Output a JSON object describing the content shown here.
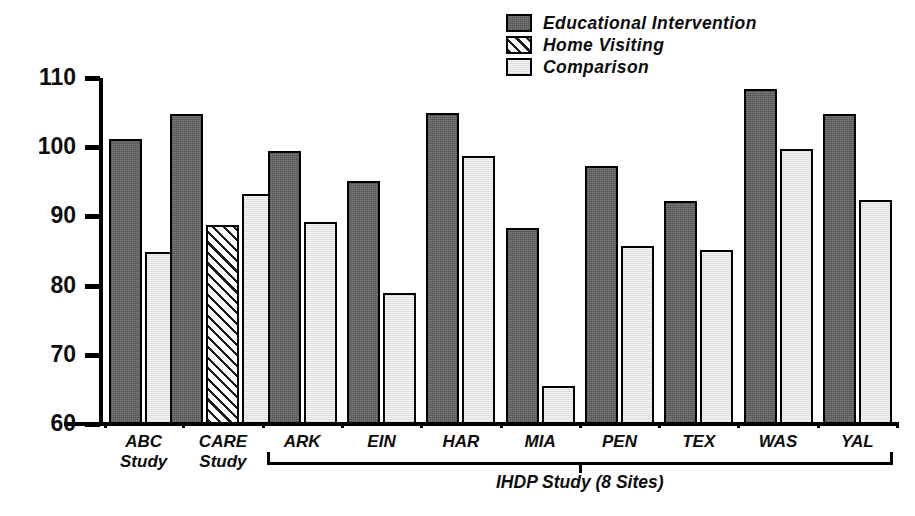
{
  "chart_data": {
    "type": "bar",
    "title": "",
    "xlabel": "",
    "ylabel": "",
    "ylim": [
      60,
      110
    ],
    "yticks": [
      60,
      70,
      80,
      90,
      100,
      110
    ],
    "grid": false,
    "legend_position": "top-right",
    "categories": [
      "ABC Study",
      "CARE Study",
      "ARK",
      "EIN",
      "HAR",
      "MIA",
      "PEN",
      "TEX",
      "WAS",
      "YAL"
    ],
    "series": [
      {
        "name": "Educational Intervention",
        "color": "#6b6b6b",
        "fill": "solid-dark",
        "values": [
          101.2,
          104.8,
          99.4,
          95.1,
          105.0,
          88.3,
          97.3,
          92.2,
          108.4,
          104.8
        ]
      },
      {
        "name": "Home Visiting",
        "color": "#ffffff",
        "fill": "diagonal-hatch",
        "values": [
          null,
          88.7,
          null,
          null,
          null,
          null,
          null,
          null,
          null,
          null
        ]
      },
      {
        "name": "Comparison",
        "color": "#e9e9e9",
        "fill": "solid-light",
        "values": [
          84.8,
          93.2,
          89.2,
          78.9,
          98.7,
          65.5,
          85.7,
          85.2,
          99.8,
          92.3
        ]
      }
    ],
    "annotations": [
      {
        "text": "IHDP Study (8 Sites)",
        "covers": [
          "ARK",
          "EIN",
          "HAR",
          "MIA",
          "PEN",
          "TEX",
          "WAS",
          "YAL"
        ]
      }
    ]
  },
  "legend": {
    "items": [
      {
        "label": "Educational Intervention",
        "fill": "fill-dark"
      },
      {
        "label": "Home Visiting",
        "fill": "fill-hatch"
      },
      {
        "label": "Comparison",
        "fill": "fill-light"
      }
    ]
  },
  "axis": {
    "y_ticks": [
      "110",
      "100",
      "90",
      "80",
      "70",
      "60"
    ]
  },
  "groups": [
    {
      "label": "ABC\nStudy"
    },
    {
      "label": "CARE\nStudy"
    },
    {
      "label": "ARK"
    },
    {
      "label": "EIN"
    },
    {
      "label": "HAR"
    },
    {
      "label": "MIA"
    },
    {
      "label": "PEN"
    },
    {
      "label": "TEX"
    },
    {
      "label": "WAS"
    },
    {
      "label": "YAL"
    }
  ],
  "bracket": {
    "label": "IHDP Study (8 Sites)"
  }
}
